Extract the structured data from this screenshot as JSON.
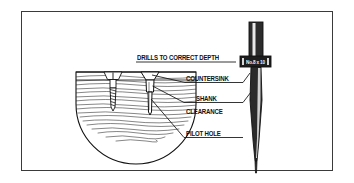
{
  "figure": {
    "frame_color": "#3a3a3a",
    "background": "#ffffff",
    "ink_color": "#111111"
  },
  "labels": {
    "depth": "DRILLS TO CORRECT DEPTH",
    "countersink": "COUNTERSINK",
    "shank": "SHANK",
    "clearance": "CLEARANCE",
    "pilot_hole": "PILOT HOLE"
  },
  "drill_bit": {
    "size_marking": "No.8 x 10",
    "parts": {
      "shank": "drill-bit-shank",
      "collar": "drill-bit-collar",
      "flute": "drill-bit-flute",
      "point": "drill-bit-point"
    }
  },
  "workpiece": {
    "material": "wood-cross-section",
    "features": [
      "countersink",
      "shank-clearance",
      "pilot-hole",
      "wood-grain"
    ],
    "screw": "flat-head-wood-screw"
  }
}
